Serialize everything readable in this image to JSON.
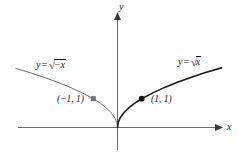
{
  "chart_data": {
    "type": "line",
    "title": "",
    "xlabel": "x",
    "ylabel": "y",
    "grid": false,
    "legend": "none",
    "xlim": [
      -4.2,
      4.6
    ],
    "ylim": [
      -0.6,
      2.6
    ],
    "axes": {
      "x_axis_label": "x",
      "y_axis_label": "y",
      "x_arrow": true,
      "y_arrow": true,
      "origin": [
        0,
        0
      ]
    },
    "series": [
      {
        "name": "y = sqrt(-x)",
        "label_text": "y =",
        "label_radical": "√",
        "label_radicand": "−x",
        "color": "#707070",
        "linewidth": 1.0,
        "domain": [
          -4.2,
          0
        ],
        "x": [
          -4.2,
          -3.6,
          -3.0,
          -2.5,
          -2.0,
          -1.5,
          -1.0,
          -0.7,
          -0.45,
          -0.25,
          -0.1,
          -0.03,
          0
        ],
        "y": [
          2.05,
          1.9,
          1.73,
          1.58,
          1.41,
          1.22,
          1.0,
          0.84,
          0.67,
          0.5,
          0.32,
          0.17,
          0
        ]
      },
      {
        "name": "y = sqrt(x)",
        "label_text": "y =",
        "label_radical": "√",
        "label_radicand": "x",
        "color": "#1a1a1a",
        "linewidth": 1.6,
        "domain": [
          0,
          4.6
        ],
        "x": [
          0,
          0.03,
          0.1,
          0.25,
          0.45,
          0.7,
          1.0,
          1.5,
          2.0,
          2.5,
          3.0,
          3.6,
          4.3
        ],
        "y": [
          0,
          0.17,
          0.32,
          0.5,
          0.67,
          0.84,
          1.0,
          1.22,
          1.41,
          1.58,
          1.73,
          1.9,
          2.07
        ]
      }
    ],
    "points": [
      {
        "name": "point-neg-one-one",
        "label": "(−1, 1)",
        "x": -1,
        "y": 1,
        "color": "#6e6e6e",
        "marker": "square"
      },
      {
        "name": "point-one-one",
        "label": "(1, 1)",
        "x": 1,
        "y": 1,
        "color": "#111111",
        "marker": "circle"
      }
    ],
    "colors": {
      "axis": "#6b6b6b",
      "left_curve": "#707070",
      "right_curve": "#1a1a1a",
      "text": "#1a1a1a",
      "background": "#ffffff"
    }
  },
  "labels": {
    "y_axis": "y",
    "x_axis": "x",
    "left_equation": {
      "lhs": "y",
      "eq": "=",
      "radical": "√",
      "radicand": "−x"
    },
    "right_equation": {
      "lhs": "y",
      "eq": "=",
      "radical": "√",
      "radicand": "x"
    },
    "left_point": "(−1, 1)",
    "right_point": "(1, 1)"
  }
}
